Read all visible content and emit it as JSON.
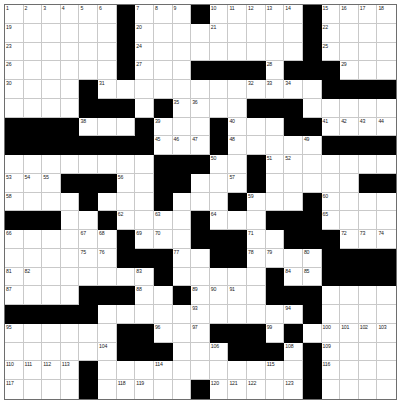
{
  "puzzle": {
    "type": "crossword-grid",
    "rows": 21,
    "cols": 21,
    "colors": {
      "block": "#000000",
      "cell": "#ffffff",
      "gridline": "#c9c9c9",
      "border": "#6e6e6e",
      "number": "#1a1a1a"
    },
    "blocks": [
      [
        0,
        6
      ],
      [
        0,
        10
      ],
      [
        0,
        16
      ],
      [
        1,
        6
      ],
      [
        1,
        16
      ],
      [
        2,
        6
      ],
      [
        2,
        16
      ],
      [
        3,
        6
      ],
      [
        3,
        10
      ],
      [
        3,
        11
      ],
      [
        3,
        12
      ],
      [
        3,
        13
      ],
      [
        3,
        15
      ],
      [
        3,
        16
      ],
      [
        3,
        17
      ],
      [
        4,
        4
      ],
      [
        4,
        17
      ],
      [
        4,
        18
      ],
      [
        4,
        19
      ],
      [
        4,
        20
      ],
      [
        5,
        4
      ],
      [
        5,
        5
      ],
      [
        5,
        6
      ],
      [
        5,
        8
      ],
      [
        5,
        13
      ],
      [
        5,
        14
      ],
      [
        5,
        15
      ],
      [
        6,
        0
      ],
      [
        6,
        1
      ],
      [
        6,
        2
      ],
      [
        6,
        3
      ],
      [
        6,
        7
      ],
      [
        6,
        11
      ],
      [
        6,
        15
      ],
      [
        6,
        16
      ],
      [
        7,
        0
      ],
      [
        7,
        1
      ],
      [
        7,
        2
      ],
      [
        7,
        3
      ],
      [
        7,
        4
      ],
      [
        7,
        5
      ],
      [
        7,
        6
      ],
      [
        7,
        7
      ],
      [
        7,
        11
      ],
      [
        7,
        17
      ],
      [
        7,
        18
      ],
      [
        7,
        19
      ],
      [
        7,
        20
      ],
      [
        8,
        8
      ],
      [
        8,
        9
      ],
      [
        8,
        10
      ],
      [
        8,
        13
      ],
      [
        9,
        3
      ],
      [
        9,
        4
      ],
      [
        9,
        5
      ],
      [
        9,
        8
      ],
      [
        9,
        9
      ],
      [
        9,
        13
      ],
      [
        9,
        19
      ],
      [
        9,
        20
      ],
      [
        10,
        4
      ],
      [
        10,
        8
      ],
      [
        10,
        12
      ],
      [
        10,
        16
      ],
      [
        11,
        0
      ],
      [
        11,
        1
      ],
      [
        11,
        2
      ],
      [
        11,
        5
      ],
      [
        11,
        10
      ],
      [
        11,
        14
      ],
      [
        11,
        15
      ],
      [
        11,
        16
      ],
      [
        12,
        6
      ],
      [
        12,
        10
      ],
      [
        12,
        11
      ],
      [
        12,
        12
      ],
      [
        12,
        15
      ],
      [
        12,
        16
      ],
      [
        12,
        17
      ],
      [
        13,
        6
      ],
      [
        13,
        7
      ],
      [
        13,
        8
      ],
      [
        13,
        11
      ],
      [
        13,
        12
      ],
      [
        13,
        17
      ],
      [
        13,
        18
      ],
      [
        13,
        19
      ],
      [
        13,
        20
      ],
      [
        14,
        8
      ],
      [
        14,
        14
      ],
      [
        14,
        17
      ],
      [
        14,
        18
      ],
      [
        14,
        19
      ],
      [
        14,
        20
      ],
      [
        15,
        4
      ],
      [
        15,
        5
      ],
      [
        15,
        6
      ],
      [
        15,
        9
      ],
      [
        15,
        14
      ],
      [
        15,
        15
      ],
      [
        15,
        16
      ],
      [
        16,
        0
      ],
      [
        16,
        1
      ],
      [
        16,
        2
      ],
      [
        16,
        3
      ],
      [
        16,
        4
      ],
      [
        16,
        16
      ],
      [
        17,
        6
      ],
      [
        17,
        7
      ],
      [
        17,
        11
      ],
      [
        17,
        12
      ],
      [
        17,
        13
      ],
      [
        17,
        15
      ],
      [
        18,
        6
      ],
      [
        18,
        7
      ],
      [
        18,
        8
      ],
      [
        18,
        12
      ],
      [
        18,
        13
      ],
      [
        18,
        14
      ],
      [
        18,
        16
      ],
      [
        19,
        4
      ],
      [
        19,
        16
      ],
      [
        20,
        4
      ],
      [
        20,
        10
      ],
      [
        20,
        16
      ]
    ],
    "numbers": [
      [
        0,
        0,
        "1"
      ],
      [
        0,
        1,
        "2"
      ],
      [
        0,
        2,
        "3"
      ],
      [
        0,
        3,
        "4"
      ],
      [
        0,
        4,
        "5"
      ],
      [
        0,
        5,
        "6"
      ],
      [
        0,
        7,
        "7"
      ],
      [
        0,
        8,
        "8"
      ],
      [
        0,
        9,
        "9"
      ],
      [
        0,
        11,
        "10"
      ],
      [
        0,
        12,
        "11"
      ],
      [
        0,
        13,
        "12"
      ],
      [
        0,
        14,
        "13"
      ],
      [
        0,
        15,
        "14"
      ],
      [
        0,
        17,
        "15"
      ],
      [
        0,
        18,
        "16"
      ],
      [
        0,
        19,
        "17"
      ],
      [
        0,
        20,
        "18"
      ],
      [
        1,
        0,
        "19"
      ],
      [
        1,
        7,
        "20"
      ],
      [
        1,
        11,
        "21"
      ],
      [
        1,
        17,
        "22"
      ],
      [
        2,
        0,
        "23"
      ],
      [
        2,
        7,
        "24"
      ],
      [
        2,
        17,
        "25"
      ],
      [
        3,
        0,
        "26"
      ],
      [
        3,
        7,
        "27"
      ],
      [
        3,
        14,
        "28"
      ],
      [
        3,
        18,
        "29"
      ],
      [
        4,
        0,
        "30"
      ],
      [
        4,
        5,
        "31"
      ],
      [
        4,
        13,
        "32"
      ],
      [
        4,
        14,
        "33"
      ],
      [
        4,
        15,
        "34"
      ],
      [
        5,
        9,
        "35"
      ],
      [
        5,
        10,
        "36"
      ],
      [
        6,
        0,
        "37"
      ],
      [
        6,
        4,
        "38"
      ],
      [
        6,
        8,
        "39"
      ],
      [
        6,
        12,
        "40"
      ],
      [
        6,
        17,
        "41"
      ],
      [
        6,
        18,
        "42"
      ],
      [
        6,
        19,
        "43"
      ],
      [
        6,
        20,
        "44"
      ],
      [
        7,
        8,
        "45"
      ],
      [
        7,
        9,
        "46"
      ],
      [
        7,
        10,
        "47"
      ],
      [
        7,
        12,
        "48"
      ],
      [
        7,
        16,
        "49"
      ],
      [
        8,
        11,
        "50"
      ],
      [
        8,
        14,
        "51"
      ],
      [
        8,
        15,
        "52"
      ],
      [
        9,
        0,
        "53"
      ],
      [
        9,
        1,
        "54"
      ],
      [
        9,
        2,
        "55"
      ],
      [
        9,
        6,
        "56"
      ],
      [
        9,
        12,
        "57"
      ],
      [
        10,
        0,
        "58"
      ],
      [
        10,
        13,
        "59"
      ],
      [
        10,
        17,
        "60"
      ],
      [
        11,
        0,
        "61"
      ],
      [
        11,
        6,
        "62"
      ],
      [
        11,
        8,
        "63"
      ],
      [
        11,
        11,
        "64"
      ],
      [
        11,
        17,
        "65"
      ],
      [
        12,
        0,
        "66"
      ],
      [
        12,
        4,
        "67"
      ],
      [
        12,
        5,
        "68"
      ],
      [
        12,
        7,
        "69"
      ],
      [
        12,
        8,
        "70"
      ],
      [
        12,
        13,
        "71"
      ],
      [
        12,
        18,
        "72"
      ],
      [
        12,
        19,
        "73"
      ],
      [
        12,
        20,
        "74"
      ],
      [
        13,
        4,
        "75"
      ],
      [
        13,
        5,
        "76"
      ],
      [
        13,
        9,
        "77"
      ],
      [
        13,
        13,
        "78"
      ],
      [
        13,
        14,
        "79"
      ],
      [
        13,
        16,
        "80"
      ],
      [
        14,
        0,
        "81"
      ],
      [
        14,
        1,
        "82"
      ],
      [
        14,
        7,
        "83"
      ],
      [
        14,
        15,
        "84"
      ],
      [
        14,
        16,
        "85"
      ],
      [
        15,
        0,
        "87"
      ],
      [
        15,
        7,
        "88"
      ],
      [
        15,
        10,
        "89"
      ],
      [
        15,
        11,
        "90"
      ],
      [
        15,
        12,
        "91"
      ],
      [
        14,
        17,
        "86"
      ],
      [
        16,
        0,
        "92"
      ],
      [
        16,
        10,
        "93"
      ],
      [
        16,
        15,
        "94"
      ],
      [
        17,
        0,
        "95"
      ],
      [
        17,
        8,
        "96"
      ],
      [
        17,
        10,
        "97"
      ],
      [
        17,
        12,
        "98"
      ],
      [
        17,
        14,
        "99"
      ],
      [
        17,
        17,
        "100"
      ],
      [
        17,
        18,
        "101"
      ],
      [
        17,
        19,
        "102"
      ],
      [
        17,
        20,
        "103"
      ],
      [
        18,
        5,
        "104"
      ],
      [
        18,
        6,
        "105"
      ],
      [
        18,
        11,
        "106"
      ],
      [
        18,
        14,
        "107"
      ],
      [
        18,
        15,
        "108"
      ],
      [
        18,
        17,
        "109"
      ],
      [
        19,
        0,
        "110"
      ],
      [
        19,
        1,
        "111"
      ],
      [
        19,
        2,
        "112"
      ],
      [
        19,
        3,
        "113"
      ],
      [
        19,
        8,
        "114"
      ],
      [
        19,
        14,
        "115"
      ],
      [
        19,
        17,
        "116"
      ],
      [
        20,
        0,
        "117"
      ],
      [
        20,
        6,
        "118"
      ],
      [
        20,
        7,
        "119"
      ],
      [
        20,
        11,
        "120"
      ],
      [
        20,
        12,
        "121"
      ],
      [
        20,
        13,
        "122"
      ],
      [
        20,
        15,
        "123"
      ]
    ],
    "numbers_extra": [
      [
        15,
        0,
        "87"
      ],
      [
        16,
        0,
        "92"
      ]
    ]
  }
}
